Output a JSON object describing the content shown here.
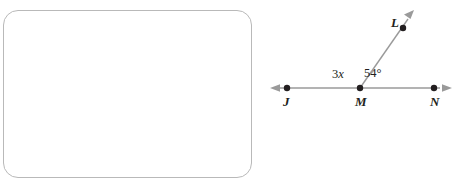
{
  "figure": {
    "type": "geometry-angle-diagram",
    "line": {
      "name": "line-JN",
      "double_arrow": true,
      "points": [
        "J",
        "M",
        "N"
      ]
    },
    "ray": {
      "name": "ray-ML",
      "from": "M",
      "through": "L",
      "arrow": true
    },
    "point_labels": {
      "J": "J",
      "M": "M",
      "N": "N",
      "L": "L"
    },
    "angle_labels": {
      "left": {
        "coefficient": "3",
        "variable": "x",
        "full": "3x",
        "description": "angle JML"
      },
      "right": {
        "value": "54",
        "unit": "°",
        "full": "54°",
        "description": "angle LMN"
      }
    },
    "colors": {
      "line": "#9a9a9a",
      "dot": "#231f20",
      "text": "#231f20",
      "box_border": "#b9b9b9",
      "background": "#ffffff"
    }
  },
  "answer_box": {
    "label": "answer-area",
    "content": ""
  }
}
